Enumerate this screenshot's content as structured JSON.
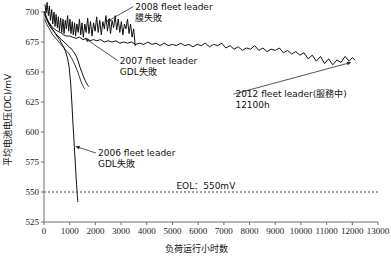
{
  "chart_data": {
    "type": "line",
    "title": "",
    "xlabel": "负荷运行小时数",
    "ylabel": "平均电池电压(DC)/mV",
    "xlim": [
      0,
      13000
    ],
    "ylim": [
      525,
      700
    ],
    "xticks": [
      "0",
      "1000",
      "2000",
      "3000",
      "4000",
      "5000",
      "6000",
      "7000",
      "8000",
      "9000",
      "10000",
      "11000",
      "12000",
      "13000"
    ],
    "yticks": [
      "525",
      "550",
      "575",
      "600",
      "625",
      "650",
      "675",
      "700"
    ],
    "grid": false,
    "legend_position": "none",
    "annotations": [
      {
        "id": "anno-2008",
        "line1": "2008 fleet leader",
        "line2": "膜失敗",
        "x_text": 3550,
        "y_text": 702,
        "point_x": 2450,
        "point_y": 692
      },
      {
        "id": "anno-2007",
        "line1": "2007 fleet leader",
        "line2": "GDL失敗",
        "x_text": 2950,
        "y_text": 657,
        "point_x": 1600,
        "point_y": 678
      },
      {
        "id": "anno-2006",
        "line1": "2006 fleet leader",
        "line2": "GDL失敗",
        "x_text": 2100,
        "y_text": 580,
        "point_x": 1230,
        "point_y": 588
      },
      {
        "id": "anno-2012",
        "line1": "2012 fleet leader(服務中)",
        "line2": "12100h",
        "x_text": 7450,
        "y_text": 629,
        "point_x": 11950,
        "point_y": 658
      }
    ],
    "threshold": {
      "label": "EOL：550mV",
      "value": 550,
      "label_x": 6300,
      "style": "dotted"
    },
    "series": [
      {
        "name": "2008 fleet leader",
        "note": "膜失敗",
        "points_x": [
          40,
          80,
          120,
          170,
          210,
          250,
          300,
          340,
          390,
          430,
          470,
          520,
          560,
          600,
          650,
          690,
          740,
          780,
          830,
          870,
          920,
          960,
          1010,
          1050,
          1100,
          1140,
          1190,
          1230,
          1280,
          1330,
          1380,
          1430,
          1480,
          1530,
          1590,
          1640,
          1700,
          1750,
          1810,
          1870,
          1930,
          1990,
          2050,
          2110,
          2170,
          2230,
          2290,
          2350,
          2410,
          2470,
          2530,
          2590,
          2650,
          2710,
          2770,
          2830,
          2890,
          2950,
          3010,
          3070,
          3130,
          3190,
          3250,
          3310,
          3370,
          3430,
          3490,
          3550
        ],
        "points_y": [
          706,
          699,
          708,
          697,
          705,
          693,
          702,
          690,
          700,
          688,
          698,
          687,
          696,
          684,
          695,
          683,
          694,
          682,
          693,
          686,
          697,
          684,
          694,
          682,
          692,
          681,
          691,
          680,
          690,
          683,
          694,
          681,
          691,
          679,
          690,
          683,
          695,
          682,
          692,
          680,
          691,
          684,
          696,
          683,
          693,
          681,
          692,
          686,
          697,
          684,
          694,
          682,
          693,
          687,
          697,
          685,
          694,
          683,
          692,
          681,
          690,
          686,
          694,
          682,
          690,
          679,
          686,
          672
        ]
      },
      {
        "name": "2012 fleet leader",
        "note": "服務中 12100h",
        "points_x": [
          30,
          110,
          200,
          300,
          400,
          520,
          640,
          760,
          880,
          1000,
          1120,
          1250,
          1380,
          1510,
          1640,
          1780,
          1920,
          2060,
          2200,
          2350,
          2500,
          2650,
          2800,
          2950,
          3100,
          3250,
          3400,
          3560,
          3720,
          3880,
          4040,
          4200,
          4360,
          4520,
          4680,
          4840,
          5000,
          5160,
          5320,
          5480,
          5640,
          5800,
          5960,
          6120,
          6280,
          6440,
          6600,
          6760,
          6920,
          7080,
          7240,
          7400,
          7560,
          7720,
          7880,
          8040,
          8200,
          8360,
          8520,
          8680,
          8840,
          9000,
          9160,
          9320,
          9480,
          9640,
          9800,
          9960,
          10120,
          10280,
          10440,
          10600,
          10760,
          10920,
          11080,
          11240,
          11400,
          11560,
          11720,
          11880,
          12000,
          12100
        ],
        "points_y": [
          700,
          694,
          691,
          688,
          686,
          684,
          683,
          681,
          680,
          680,
          679,
          678,
          679,
          677,
          678,
          676,
          677,
          676,
          677,
          675,
          676,
          675,
          676,
          674,
          675,
          674,
          675,
          673,
          674,
          673,
          675,
          673,
          674,
          672,
          674,
          672,
          673,
          672,
          674,
          672,
          673,
          671,
          673,
          672,
          674,
          671,
          673,
          672,
          674,
          670,
          672,
          669,
          671,
          668,
          670,
          669,
          672,
          668,
          670,
          667,
          669,
          668,
          670,
          666,
          668,
          665,
          667,
          664,
          666,
          661,
          664,
          659,
          663,
          657,
          661,
          656,
          660,
          658,
          663,
          659,
          662,
          660
        ]
      },
      {
        "name": "2007 fleet leader",
        "note": "GDL失敗",
        "points_x": [
          30,
          90,
          160,
          230,
          300,
          380,
          450,
          520,
          600,
          670,
          740,
          820,
          890,
          960,
          1040,
          1110,
          1180,
          1260,
          1330,
          1400,
          1470,
          1540,
          1600,
          1650,
          1700,
          1740
        ],
        "points_y": [
          698,
          694,
          691,
          688,
          686,
          684,
          682,
          680,
          679,
          677,
          676,
          674,
          673,
          671,
          670,
          668,
          666,
          663,
          659,
          654,
          650,
          646,
          643,
          641,
          639,
          638
        ]
      },
      {
        "name": "2006 fleet leader",
        "note": "GDL失敗",
        "points_x": [
          25,
          80,
          150,
          220,
          300,
          380,
          450,
          530,
          600,
          680,
          760,
          840,
          910,
          980,
          1040,
          1090,
          1130,
          1170,
          1200,
          1230,
          1250,
          1270,
          1285,
          1295,
          1305,
          1312,
          1318
        ],
        "points_y": [
          700,
          696,
          693,
          690,
          687,
          684,
          682,
          679,
          677,
          674,
          671,
          667,
          662,
          654,
          640,
          622,
          606,
          592,
          580,
          570,
          562,
          556,
          551,
          547,
          545,
          543,
          542
        ]
      },
      {
        "name": "2007 fleet leader secondary",
        "note": "parallel trace",
        "points_x": [
          30,
          100,
          180,
          260,
          340,
          420,
          500,
          580,
          660,
          740,
          820,
          900,
          980,
          1060,
          1140,
          1220,
          1300,
          1380,
          1440,
          1500,
          1550,
          1590
        ],
        "points_y": [
          694,
          690,
          687,
          684,
          681,
          679,
          677,
          675,
          673,
          671,
          669,
          667,
          665,
          662,
          659,
          655,
          651,
          646,
          642,
          639,
          637,
          636
        ]
      }
    ]
  }
}
